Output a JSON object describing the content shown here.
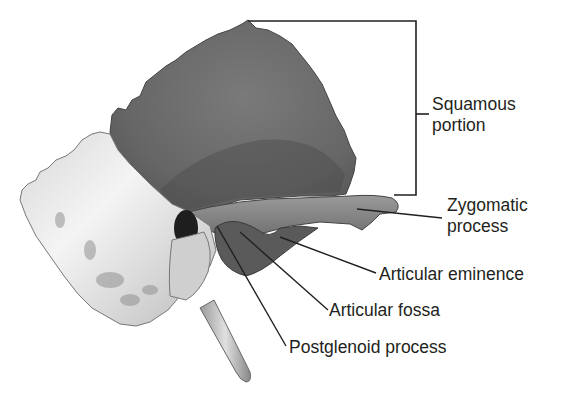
{
  "figure": {
    "labels": {
      "squamous_line1": "Squamous",
      "squamous_line2": "portion",
      "zygomatic_line1": "Zygomatic",
      "zygomatic_line2": "process",
      "articular_eminence": "Articular eminence",
      "articular_fossa": "Articular fossa",
      "postglenoid_process": "Postglenoid process"
    },
    "colors": {
      "squamous_fill": "#6e6e6e",
      "squamous_dark": "#4a4a4a",
      "mastoid_fill": "#e6e6e6",
      "zygomatic_fill": "#8a8a8a",
      "leader_lines": "#231f20",
      "text": "#231f20"
    }
  }
}
